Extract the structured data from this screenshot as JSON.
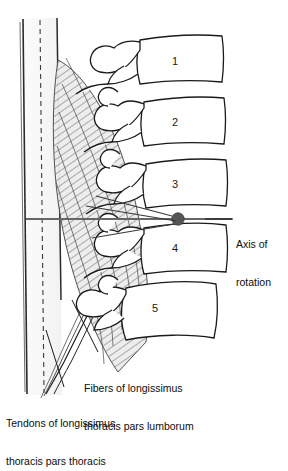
{
  "figure": {
    "background_color": "#ffffff",
    "line_color": "#1a1a1a",
    "muscle_hatch_color": "#808080",
    "muscle_fill_color": "#e8e8e8",
    "axis_dot_color": "#555555",
    "axis_line_color": "#666666"
  },
  "vertebrae": [
    {
      "number": "1",
      "x": 172,
      "y": 61
    },
    {
      "number": "2",
      "x": 172,
      "y": 122
    },
    {
      "number": "3",
      "x": 172,
      "y": 183
    },
    {
      "number": "4",
      "x": 172,
      "y": 248
    },
    {
      "number": "5",
      "x": 152,
      "y": 308
    }
  ],
  "annotations": {
    "axis_of_rotation": {
      "line1": "Axis of",
      "line2": "rotation",
      "dot_x": 178,
      "dot_y": 219,
      "line_start_x": 26,
      "line_end_x": 232,
      "line_y": 219
    },
    "fibers": {
      "line1": "Fibers of longissimus",
      "line2": "thoracis pars lumborum",
      "leader_from_x": 98,
      "leader_from_y": 352,
      "leader_to_x": 72,
      "leader_to_y": 300
    },
    "tendons": {
      "line1": "Tendons of longissimus",
      "line2": "thoracis pars thoracis",
      "leader_from_x": 64,
      "leader_from_y": 387,
      "leader_to_x": 46,
      "leader_to_y": 330
    }
  },
  "guides": {
    "solid_line_left_x": 22,
    "dashed_line_x": 40,
    "solid_line_right_x": 58,
    "top_y": 18,
    "bottom_y": 395
  }
}
